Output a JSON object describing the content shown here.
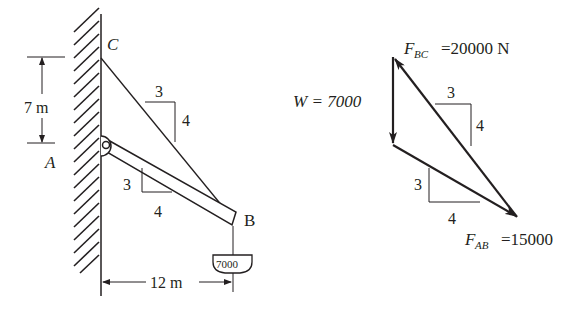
{
  "figure": {
    "type": "statics-diagram",
    "left_diagram": {
      "title": "Boom and cable support",
      "points": {
        "C": "C",
        "A": "A",
        "B": "B"
      },
      "dimensions": {
        "vertical": "7 m",
        "horizontal": "12 m"
      },
      "slopes": {
        "cable_BC": {
          "rise": "4",
          "run": "3"
        },
        "boom_AB": {
          "rise": "3",
          "run": "4"
        }
      },
      "load_label": "7000"
    },
    "right_diagram": {
      "title": "Force triangle",
      "weight_label": "W = 7000",
      "fbc_symbol": "F",
      "fbc_subscript": "BC",
      "fbc_value": "=20000 N",
      "fab_symbol": "F",
      "fab_subscript": "AB",
      "fab_value": "=15000",
      "slopes": {
        "fbc": {
          "rise": "4",
          "run": "3"
        },
        "fab": {
          "rise": "3",
          "run": "4"
        }
      }
    },
    "colors": {
      "ink": "#231f20",
      "background": "#ffffff"
    }
  }
}
